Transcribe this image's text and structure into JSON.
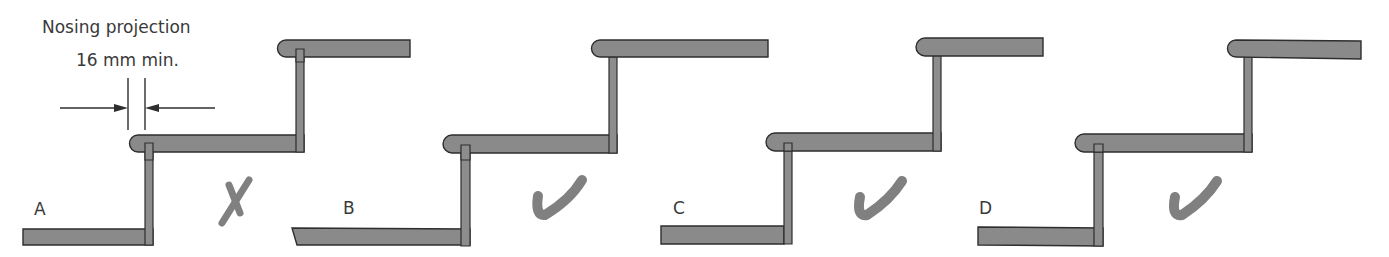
{
  "annotation": {
    "line1": "Nosing projection",
    "line2": "16 mm min."
  },
  "colors": {
    "wood": "#8a8a8a",
    "outline": "#2e2e2e",
    "mark": "#808080",
    "text": "#3a3a3a"
  },
  "panels": [
    {
      "label": "A",
      "verdict": "incorrect",
      "verdict_icon": "cross-icon"
    },
    {
      "label": "B",
      "verdict": "correct",
      "verdict_icon": "check-icon"
    },
    {
      "label": "C",
      "verdict": "correct",
      "verdict_icon": "check-icon"
    },
    {
      "label": "D",
      "verdict": "correct",
      "verdict_icon": "check-icon"
    }
  ]
}
